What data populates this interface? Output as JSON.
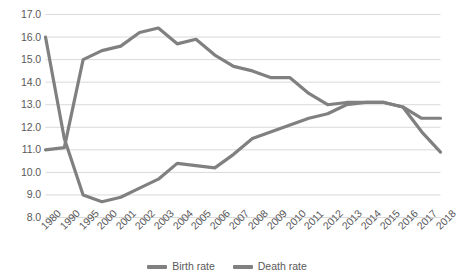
{
  "chart_data": {
    "type": "line",
    "title": "",
    "subtitle": "",
    "xlabel": "",
    "ylabel": "",
    "ylim": [
      8.0,
      17.0
    ],
    "ystep": 1.0,
    "grid": true,
    "legend_position": "bottom",
    "categories": [
      "1980",
      "1990",
      "1995",
      "2000",
      "2001",
      "2002",
      "2003",
      "2004",
      "2005",
      "2006",
      "2007",
      "2008",
      "2009",
      "2010",
      "2011",
      "2012",
      "2013",
      "2014",
      "2015",
      "2016",
      "2017",
      "2018"
    ],
    "ytick_labels": [
      "17.0",
      "16.0",
      "15.0",
      "14.0",
      "13.0",
      "12.0",
      "11.0",
      "10.0",
      "9.0",
      "8.0"
    ],
    "series": [
      {
        "name": "Birth rate",
        "color": "#808080",
        "values": [
          16.0,
          11.5,
          9.0,
          8.7,
          8.9,
          9.3,
          9.7,
          10.4,
          10.3,
          10.2,
          10.8,
          11.5,
          11.8,
          12.1,
          12.4,
          12.6,
          13.0,
          13.1,
          13.1,
          12.9,
          12.4,
          12.4
        ]
      },
      {
        "name": "Death rate",
        "color": "#808080",
        "values": [
          11.0,
          11.1,
          15.0,
          15.4,
          15.6,
          16.2,
          16.4,
          15.7,
          15.9,
          15.2,
          14.7,
          14.5,
          14.2,
          14.2,
          13.5,
          13.0,
          13.1,
          13.1,
          13.1,
          12.9,
          11.8,
          10.9
        ]
      }
    ],
    "legend": [
      {
        "label": "Birth rate",
        "color": "#808080"
      },
      {
        "label": "Death rate",
        "color": "#808080"
      }
    ],
    "style": {
      "grid_color": "#d9d9d9",
      "line_color": "#808080",
      "line_width": 3.2,
      "background": "#ffffff",
      "text_color": "#595959"
    }
  }
}
